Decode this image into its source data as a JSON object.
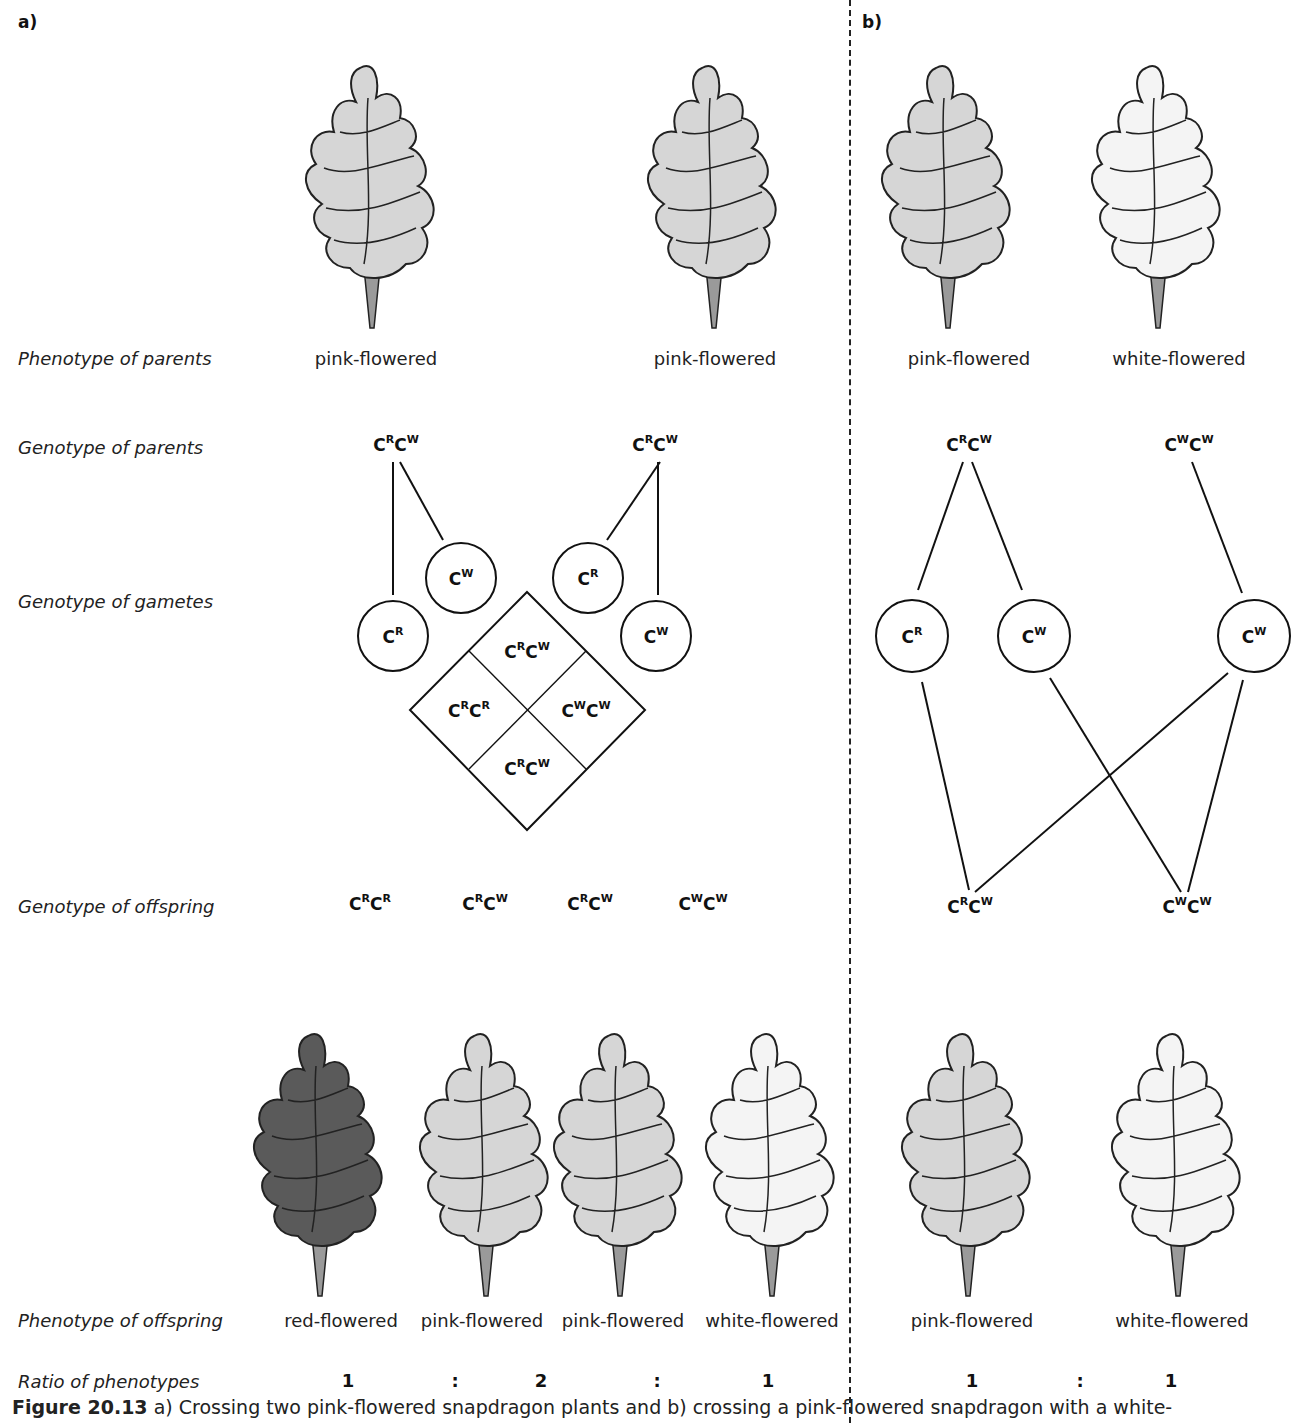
{
  "panels": {
    "a": {
      "label": "a)"
    },
    "b": {
      "label": "b)"
    }
  },
  "row_labels": {
    "phenotype_parents": "Phenotype of parents",
    "genotype_parents": "Genotype of parents",
    "genotype_gametes": "Genotype of gametes",
    "genotype_offspring": "Genotype of offspring",
    "phenotype_offspring": "Phenotype of offspring",
    "ratio": "Ratio of phenotypes"
  },
  "panel_a": {
    "parents": [
      {
        "phenotype": "pink-flowered",
        "genotype": {
          "a1": "C",
          "s1": "R",
          "a2": "C",
          "s2": "W"
        },
        "shade": "pink"
      },
      {
        "phenotype": "pink-flowered",
        "genotype": {
          "a1": "C",
          "s1": "R",
          "a2": "C",
          "s2": "W"
        },
        "shade": "pink"
      }
    ],
    "gametes": [
      {
        "base": "C",
        "sup": "R"
      },
      {
        "base": "C",
        "sup": "W"
      },
      {
        "base": "C",
        "sup": "R"
      },
      {
        "base": "C",
        "sup": "W"
      }
    ],
    "punnett": [
      {
        "a1": "C",
        "s1": "R",
        "a2": "C",
        "s2": "W"
      },
      {
        "a1": "C",
        "s1": "R",
        "a2": "C",
        "s2": "R"
      },
      {
        "a1": "C",
        "s1": "W",
        "a2": "C",
        "s2": "W"
      },
      {
        "a1": "C",
        "s1": "R",
        "a2": "C",
        "s2": "W"
      }
    ],
    "offspring": [
      {
        "genotype": {
          "a1": "C",
          "s1": "R",
          "a2": "C",
          "s2": "R"
        },
        "phenotype": "red-flowered",
        "shade": "red"
      },
      {
        "genotype": {
          "a1": "C",
          "s1": "R",
          "a2": "C",
          "s2": "W"
        },
        "phenotype": "pink-flowered",
        "shade": "pink"
      },
      {
        "genotype": {
          "a1": "C",
          "s1": "R",
          "a2": "C",
          "s2": "W"
        },
        "phenotype": "pink-flowered",
        "shade": "pink"
      },
      {
        "genotype": {
          "a1": "C",
          "s1": "W",
          "a2": "C",
          "s2": "W"
        },
        "phenotype": "white-flowered",
        "shade": "white"
      }
    ],
    "ratio": [
      "1",
      ":",
      "2",
      ":",
      "1"
    ]
  },
  "panel_b": {
    "parents": [
      {
        "phenotype": "pink-flowered",
        "genotype": {
          "a1": "C",
          "s1": "R",
          "a2": "C",
          "s2": "W"
        },
        "shade": "pink"
      },
      {
        "phenotype": "white-flowered",
        "genotype": {
          "a1": "C",
          "s1": "W",
          "a2": "C",
          "s2": "W"
        },
        "shade": "white"
      }
    ],
    "gametes": [
      {
        "base": "C",
        "sup": "R"
      },
      {
        "base": "C",
        "sup": "W"
      },
      {
        "base": "C",
        "sup": "W"
      }
    ],
    "offspring": [
      {
        "genotype": {
          "a1": "C",
          "s1": "R",
          "a2": "C",
          "s2": "W"
        },
        "phenotype": "pink-flowered",
        "shade": "pink"
      },
      {
        "genotype": {
          "a1": "C",
          "s1": "W",
          "a2": "C",
          "s2": "W"
        },
        "phenotype": "white-flowered",
        "shade": "white"
      }
    ],
    "ratio": [
      "1",
      ":",
      "1"
    ]
  },
  "caption": {
    "label": "Figure 20.13",
    "text": " a) Crossing two pink-flowered snapdragon plants and b) crossing a pink-flowered snapdragon with a white-"
  },
  "colors": {
    "red": "#555555",
    "pink": "#d4d4d4",
    "white": "#f6f6f6",
    "stem": "#9a9a9a",
    "line": "#111111"
  }
}
